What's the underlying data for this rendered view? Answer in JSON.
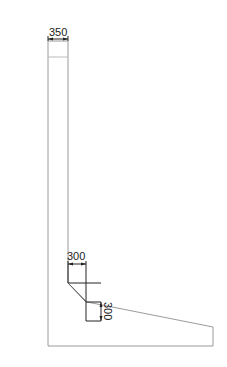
{
  "diagram": {
    "type": "retaining-wall-section",
    "line_color": "#9a9a9a",
    "dim_color": "#222222",
    "dimensions": {
      "top_width": "350",
      "haunch_width": "300",
      "haunch_height": "300"
    }
  }
}
